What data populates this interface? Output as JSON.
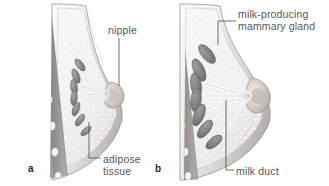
{
  "figure": {
    "background_color": "#ffffff",
    "text_color": "#58585a",
    "panels": [
      {
        "letter": "a",
        "name": "non-lactating-breast",
        "description": "Cross-section of a non-lactating breast showing small mammary glands, ducts converging at the nipple, and surrounding adipose tissue against the chest wall."
      },
      {
        "letter": "b",
        "name": "lactating-breast",
        "description": "Cross-section of a lactating breast showing enlarged lobulated milk-producing mammary glands and widened milk ducts converging at a protruding nipple."
      }
    ]
  },
  "labels": {
    "nipple": "nipple",
    "adipose_line1": "adipose",
    "adipose_line2": "tissue",
    "mammary_line1": "milk-producing",
    "mammary_line2": "mammary gland",
    "milk_duct": "milk duct",
    "panel_a": "a",
    "panel_b": "b"
  },
  "colors": {
    "leader_line": "#4a4a4a",
    "label_text": "#58585a",
    "skin_light": "#f2f0ee",
    "skin_shadow": "#c9c5c2",
    "adipose_fill": "#f6f5f3",
    "adipose_stipple": "#d6d2cf",
    "gland_fill": "#8e8b88",
    "gland_dark": "#6f6c6a",
    "chest_wall": "#9a9795",
    "rib_fill": "#f4f2f0",
    "duct_fill": "#ffffff",
    "outline": "#7d7a78"
  }
}
